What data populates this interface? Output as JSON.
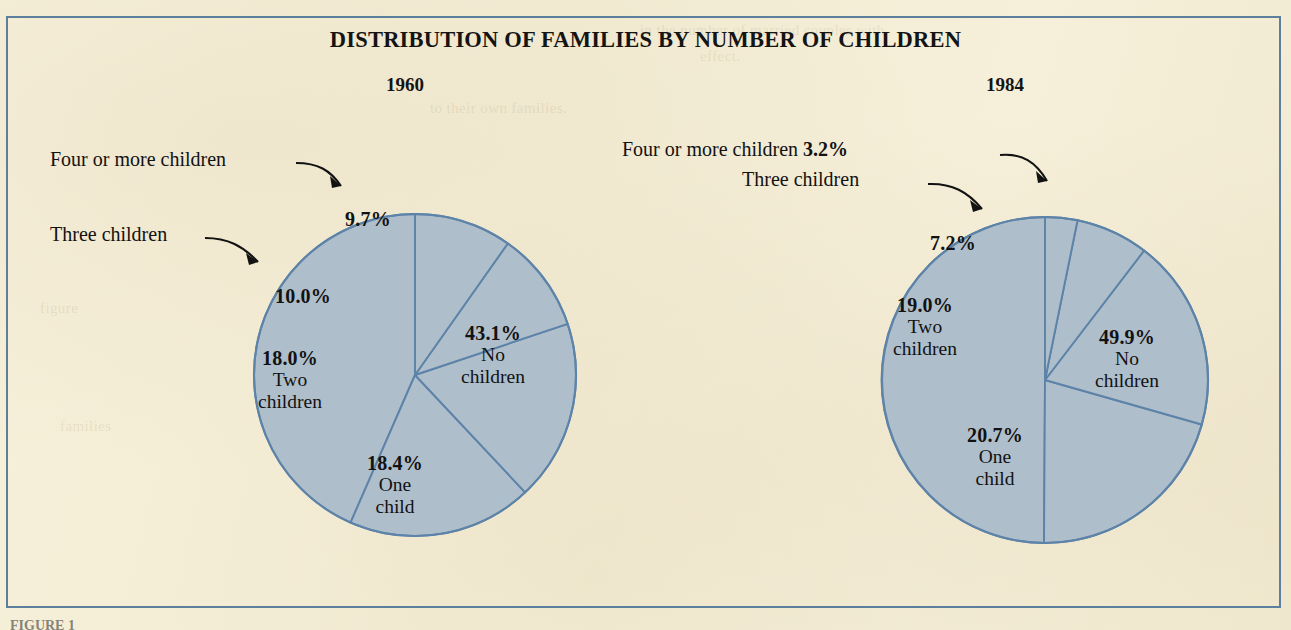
{
  "figure": {
    "title": "DISTRIBUTION OF FAMILIES BY NUMBER OF CHILDREN",
    "caption": "FIGURE 1",
    "frame_color": "#5d7f9e",
    "background_color": "#f6efd9",
    "slice_fill_color": "#aebecb",
    "slice_stroke_color": "#5d83a8",
    "text_color": "#121212"
  },
  "panels": [
    {
      "year": "1960",
      "center_x": 415,
      "center_y": 375,
      "radius": 161
    },
    {
      "year": "1984",
      "center_x": 1045,
      "center_y": 380,
      "radius": 163
    }
  ],
  "labels": {
    "p1960": {
      "no_children_pct": "43.1%",
      "no_children_l1": "No",
      "no_children_l2": "children",
      "one_child_pct": "18.4%",
      "one_child_l1": "One",
      "one_child_l2": "child",
      "two_children_pct": "18.0%",
      "two_children_l1": "Two",
      "two_children_l2": "children",
      "three_children_pct": "10.0%",
      "four_or_more_pct": "9.7%",
      "callout_three": "Three children",
      "callout_four": "Four or more children"
    },
    "p1984": {
      "no_children_pct": "49.9%",
      "no_children_l1": "No",
      "no_children_l2": "children",
      "one_child_pct": "20.7%",
      "one_child_l1": "One",
      "one_child_l2": "child",
      "two_children_pct": "19.0%",
      "two_children_l1": "Two",
      "two_children_l2": "children",
      "three_children_pct": "7.2%",
      "callout_three": "Three children",
      "callout_four": "Four or more children",
      "callout_four_pct": "3.2%"
    }
  },
  "chart_data": [
    {
      "type": "pie",
      "title": "DISTRIBUTION OF FAMILIES BY NUMBER OF CHILDREN",
      "subtitle": "1960",
      "labels": [
        "No children",
        "One child",
        "Two children",
        "Three children",
        "Four or more children"
      ],
      "values": [
        43.1,
        18.4,
        18.0,
        10.0,
        9.7
      ],
      "value_labels": [
        "43.1%",
        "18.4%",
        "18.0%",
        "10.0%",
        "9.7%"
      ],
      "units": "percent",
      "start_angle_deg": 0,
      "direction": "counterclockwise",
      "legend": "none",
      "annotations": [
        "Three children",
        "Four or more children"
      ]
    },
    {
      "type": "pie",
      "title": "DISTRIBUTION OF FAMILIES BY NUMBER OF CHILDREN",
      "subtitle": "1984",
      "labels": [
        "No children",
        "One child",
        "Two children",
        "Three children",
        "Four or more children"
      ],
      "values": [
        49.9,
        20.7,
        19.0,
        7.2,
        3.2
      ],
      "value_labels": [
        "49.9%",
        "20.7%",
        "19.0%",
        "7.2%",
        "3.2%"
      ],
      "units": "percent",
      "start_angle_deg": 0,
      "direction": "counterclockwise",
      "legend": "none",
      "annotations": [
        "Three children",
        "Four or more children"
      ]
    }
  ]
}
